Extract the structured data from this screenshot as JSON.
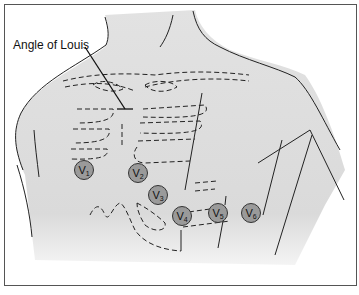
{
  "diagram": {
    "type": "anatomical-illustration",
    "annotation": {
      "label": "Angle of Louis"
    },
    "electrodes": [
      {
        "id": "V1",
        "letter": "V",
        "sub": "1"
      },
      {
        "id": "V2",
        "letter": "V",
        "sub": "2"
      },
      {
        "id": "V3",
        "letter": "V",
        "sub": "3"
      },
      {
        "id": "V4",
        "letter": "V",
        "sub": "4"
      },
      {
        "id": "V5",
        "letter": "V",
        "sub": "5"
      },
      {
        "id": "V6",
        "letter": "V",
        "sub": "6"
      }
    ],
    "colors": {
      "skin_fill": "#dcdcdc",
      "outline": "#222222",
      "electrode_fill": "#9a9a9a",
      "border": "#555555"
    }
  }
}
